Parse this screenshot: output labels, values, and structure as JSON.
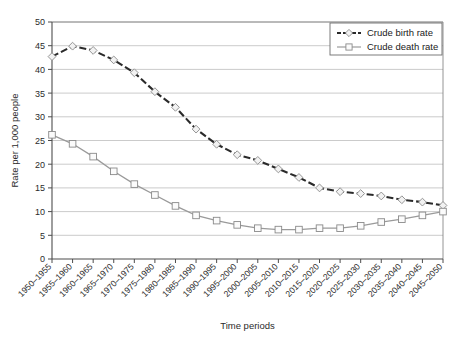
{
  "chart_data": {
    "type": "line",
    "title": "",
    "xlabel": "Time periods",
    "ylabel": "Rate per 1,000 people",
    "ylim": [
      0,
      50
    ],
    "yticks": [
      0,
      5,
      10,
      15,
      20,
      25,
      30,
      35,
      40,
      45,
      50
    ],
    "grid": true,
    "legend_position": "top-right",
    "categories": [
      "1950–1955",
      "1955–1960",
      "1960–1965",
      "1965–1970",
      "1970–1975",
      "1975–1980",
      "1980–1985",
      "1985–1990",
      "1990–1995",
      "1995–2000",
      "2000–2005",
      "2005–2010",
      "2010–2015",
      "2015–2020",
      "2020–2025",
      "2025–2030",
      "2030–2035",
      "2035–2040",
      "2040–2045",
      "2045–2050"
    ],
    "series": [
      {
        "name": "Crude birth rate",
        "marker": "diamond",
        "linestyle": "dashed",
        "color": "#2a2a2a",
        "values": [
          42.7,
          44.9,
          44.0,
          42.0,
          39.3,
          35.3,
          32.0,
          27.4,
          24.2,
          22.0,
          20.8,
          19.0,
          17.2,
          15.0,
          14.2,
          13.8,
          13.3,
          12.5,
          12.0,
          11.3
        ]
      },
      {
        "name": "Crude death rate",
        "marker": "square",
        "linestyle": "solid",
        "color": "#9a9a9a",
        "values": [
          26.2,
          24.3,
          21.6,
          18.5,
          15.8,
          13.5,
          11.2,
          9.2,
          8.1,
          7.2,
          6.5,
          6.2,
          6.2,
          6.5,
          6.5,
          7.0,
          7.8,
          8.4,
          9.2,
          10.0
        ]
      }
    ]
  },
  "legend": {
    "entries": [
      {
        "label": "Crude birth rate"
      },
      {
        "label": "Crude death rate"
      }
    ]
  }
}
